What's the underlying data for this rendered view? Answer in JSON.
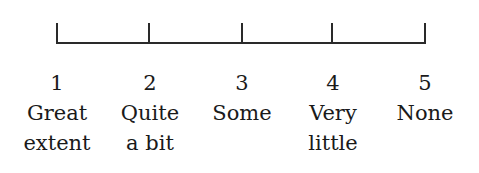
{
  "scale": {
    "points": [
      {
        "value": "1",
        "line1": "Great",
        "line2": "extent"
      },
      {
        "value": "2",
        "line1": "Quite",
        "line2": "a bit"
      },
      {
        "value": "3",
        "line1": "Some",
        "line2": ""
      },
      {
        "value": "4",
        "line1": "Very",
        "line2": "little"
      },
      {
        "value": "5",
        "line1": "None",
        "line2": ""
      }
    ]
  }
}
